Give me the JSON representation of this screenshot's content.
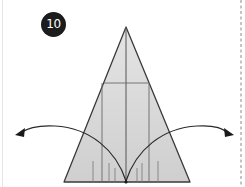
{
  "step": {
    "number": "10"
  },
  "diagram": {
    "fill_color": "#d6d6d6",
    "line_color": "#3c3c3c",
    "arrows": [
      {
        "name": "fold-left-arrow",
        "direction": "left"
      },
      {
        "name": "fold-right-arrow",
        "direction": "right"
      }
    ],
    "cut_line": {
      "style": "dashed",
      "position": "right"
    }
  }
}
